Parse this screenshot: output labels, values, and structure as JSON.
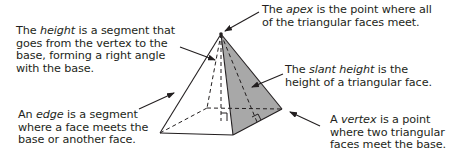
{
  "diagram": {
    "colors": {
      "text": "#231f20",
      "line": "#231f20",
      "right_face": "#a8a8a8",
      "base": "#cfcfcf",
      "left_face": "#ffffff"
    },
    "labels": {
      "height": {
        "term": "height",
        "lines": [
          "The ",
          "height",
          " is a segment that",
          "goes from the vertex to the",
          "base, forming a right angle",
          "with the base."
        ]
      },
      "apex": {
        "term": "apex",
        "lines": [
          "The ",
          "apex",
          " is the point where all",
          "of the triangular faces meet."
        ]
      },
      "slant_height": {
        "term": "slant height",
        "lines": [
          "The ",
          "slant height",
          " is the",
          "height of a triangular face."
        ]
      },
      "edge": {
        "term": "edge",
        "lines": [
          "An ",
          "edge",
          " is a segment",
          "where a face meets the",
          "base or another face."
        ]
      },
      "vertex": {
        "term": "vertex",
        "lines": [
          "A ",
          "vertex",
          " is a point",
          "where two triangular",
          "faces meet the base."
        ]
      }
    }
  }
}
